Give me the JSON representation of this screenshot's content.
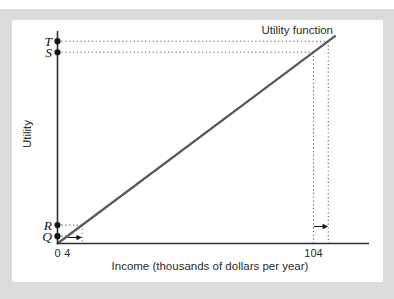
{
  "figure": {
    "background_color": "#d9dcd8",
    "panel_color": "#ffffff"
  },
  "chart_data": {
    "type": "line",
    "line_label": "Utility function",
    "xlabel": "Income (thousands of dollars per year)",
    "ylabel": "Utility",
    "x_ticks": [
      {
        "value": 0,
        "label": "0"
      },
      {
        "value": 4,
        "label": "4"
      },
      {
        "value": 104,
        "label": "104"
      }
    ],
    "series": [
      {
        "name": "Utility function",
        "x": [
          0,
          113
        ],
        "y": [
          0,
          113
        ],
        "shape": "straight-line-through-origin"
      }
    ],
    "axis_points": [
      {
        "label": "T",
        "income": 110,
        "has_vertical_guide": true
      },
      {
        "label": "S",
        "income": 104,
        "has_vertical_guide": true
      },
      {
        "label": "R",
        "income": 10,
        "has_vertical_guide": true
      },
      {
        "label": "Q",
        "income": 4,
        "has_vertical_guide": false
      }
    ],
    "increment_arrows": [
      {
        "from": 4,
        "to": 10
      },
      {
        "from": 104,
        "to": 110
      }
    ],
    "x_domain": [
      0,
      126
    ],
    "grid": false,
    "legend_position": "top-right-annotation",
    "colors": {
      "line": "#575b5e",
      "axis": "#2e2e2e",
      "dots": "#161616",
      "guides": "#5f5f5f",
      "text": "#2b2b2b"
    }
  }
}
